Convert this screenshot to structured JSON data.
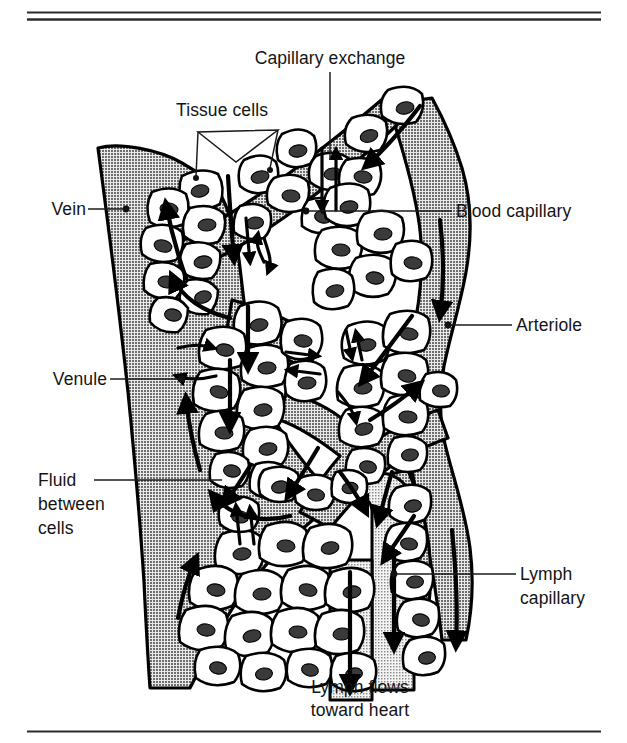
{
  "figure": {
    "title_fragment_top": "",
    "caption": {
      "line1": "Lymph flows",
      "line2": "toward heart"
    }
  },
  "labels": {
    "capillary_exchange": "Capillary exchange",
    "tissue_cells": "Tissue cells",
    "vein": "Vein",
    "venule": "Venule",
    "fluid_between_cells_l1": "Fluid",
    "fluid_between_cells_l2": "between",
    "fluid_between_cells_l3": "cells",
    "blood_capillary": "Blood capillary",
    "arteriole": "Arteriole",
    "lymph_capillary_l1": "Lymph",
    "lymph_capillary_l2": "capillary"
  },
  "colors": {
    "ink": "#141414",
    "outline": "#000000",
    "vessel_gray": "#9a9a9a",
    "lymph_gray": "#c6c6c6",
    "cell_fill": "#ffffff",
    "nucleus": "#3a3a3a",
    "rule": "#2b2b2b",
    "page": "#ffffff"
  },
  "diagram": {
    "type": "anatomical-illustration",
    "structures": [
      {
        "name": "vein",
        "label": "Vein",
        "flow_direction": "up",
        "shade": "dark-gray"
      },
      {
        "name": "venule",
        "label": "Venule",
        "flow_direction": "up",
        "shade": "dark-gray"
      },
      {
        "name": "arteriole",
        "label": "Arteriole",
        "flow_direction": "down",
        "shade": "dark-gray"
      },
      {
        "name": "blood-capillary",
        "label": "Blood capillary",
        "flow_direction": "down",
        "shade": "dark-gray"
      },
      {
        "name": "lymph-capillary",
        "label": "Lymph capillary",
        "flow_direction": "down",
        "shade": "light-gray"
      },
      {
        "name": "tissue-cells",
        "label": "Tissue cells",
        "shade": "white"
      },
      {
        "name": "fluid-between-cells",
        "label": "Fluid between cells",
        "shade": "dark-gray"
      }
    ]
  },
  "rules": {
    "top_count": 2,
    "bottom_count": 1
  }
}
